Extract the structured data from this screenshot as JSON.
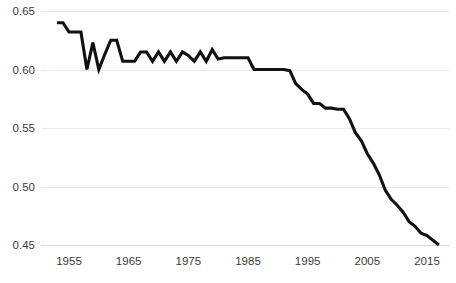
{
  "chart_data": {
    "type": "line",
    "title": "",
    "subtitle": "",
    "xlabel": "",
    "ylabel": "",
    "xlim": [
      1952.5,
      2017.5
    ],
    "ylim": [
      0.44,
      0.655
    ],
    "grid": true,
    "legend": false,
    "legend_position": "none",
    "y_ticks": [
      0.65,
      0.6,
      0.55,
      0.5,
      0.45
    ],
    "y_tick_labels": [
      "0.65",
      "0.60",
      "0.55",
      "0.50",
      "0.45"
    ],
    "x_ticks": [
      1955,
      1965,
      1975,
      1985,
      1995,
      2005,
      2015
    ],
    "x_tick_labels": [
      "1955",
      "1965",
      "1975",
      "1985",
      "1995",
      "2005",
      "2015"
    ],
    "series": [
      {
        "name": "value",
        "color": "#111111",
        "x": [
          1953,
          1954,
          1955,
          1956,
          1957,
          1958,
          1959,
          1960,
          1961,
          1962,
          1963,
          1964,
          1965,
          1966,
          1967,
          1968,
          1969,
          1970,
          1971,
          1972,
          1973,
          1974,
          1975,
          1976,
          1977,
          1978,
          1979,
          1980,
          1981,
          1982,
          1983,
          1984,
          1985,
          1986,
          1987,
          1988,
          1989,
          1990,
          1991,
          1992,
          1993,
          1994,
          1995,
          1996,
          1997,
          1998,
          1999,
          2000,
          2001,
          2002,
          2003,
          2004,
          2005,
          2006,
          2007,
          2008,
          2009,
          2010,
          2011,
          2012,
          2013,
          2014,
          2015,
          2016,
          2017
        ],
        "values": [
          0.64,
          0.64,
          0.632,
          0.632,
          0.632,
          0.6,
          0.623,
          0.6,
          0.613,
          0.625,
          0.625,
          0.607,
          0.607,
          0.607,
          0.615,
          0.615,
          0.607,
          0.615,
          0.607,
          0.615,
          0.607,
          0.615,
          0.612,
          0.607,
          0.615,
          0.607,
          0.617,
          0.609,
          0.61,
          0.61,
          0.61,
          0.61,
          0.61,
          0.6,
          0.6,
          0.6,
          0.6,
          0.6,
          0.6,
          0.599,
          0.588,
          0.583,
          0.579,
          0.571,
          0.571,
          0.567,
          0.567,
          0.566,
          0.566,
          0.558,
          0.546,
          0.539,
          0.528,
          0.52,
          0.51,
          0.497,
          0.489,
          0.484,
          0.478,
          0.47,
          0.466,
          0.46,
          0.458,
          0.454,
          0.45
        ]
      }
    ]
  }
}
